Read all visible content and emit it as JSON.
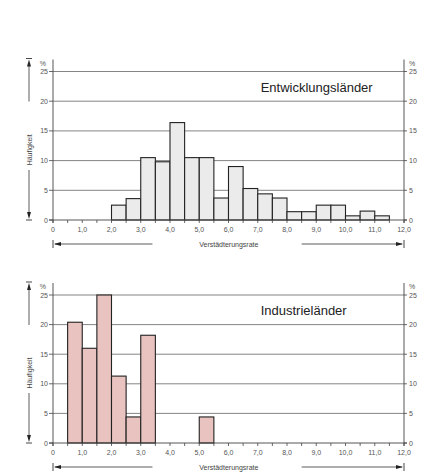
{
  "chart_data": [
    {
      "type": "bar",
      "title": "Entwicklungsländer",
      "xlabel": "Verstädterungsrate",
      "ylabel": "Häufigkeit",
      "yunit": "%",
      "xlim": [
        0,
        12
      ],
      "ylim": [
        0,
        25
      ],
      "yticks": [
        0,
        5,
        10,
        15,
        20,
        25
      ],
      "xticks": [
        "0",
        "1,0",
        "2,0",
        "3,0",
        "4,0",
        "5,0",
        "6,0",
        "7,0",
        "8,0",
        "9,0",
        "10,0",
        "11,0",
        "12,0"
      ],
      "bin_width": 0.5,
      "fill": "#ebebeb",
      "bins": [
        {
          "start": 2.0,
          "value": 2.5
        },
        {
          "start": 2.5,
          "value": 3.6
        },
        {
          "start": 3.0,
          "value": 10.5
        },
        {
          "start": 3.5,
          "value": 9.8
        },
        {
          "start": 4.0,
          "value": 16.4
        },
        {
          "start": 4.5,
          "value": 10.5
        },
        {
          "start": 5.0,
          "value": 10.5
        },
        {
          "start": 5.5,
          "value": 3.7
        },
        {
          "start": 6.0,
          "value": 9.0
        },
        {
          "start": 6.5,
          "value": 5.3
        },
        {
          "start": 7.0,
          "value": 4.4
        },
        {
          "start": 7.5,
          "value": 3.7
        },
        {
          "start": 8.0,
          "value": 1.4
        },
        {
          "start": 8.5,
          "value": 1.4
        },
        {
          "start": 9.0,
          "value": 2.5
        },
        {
          "start": 9.5,
          "value": 2.5
        },
        {
          "start": 10.0,
          "value": 0.7
        },
        {
          "start": 10.5,
          "value": 1.5
        },
        {
          "start": 11.0,
          "value": 0.7
        }
      ],
      "grid": true
    },
    {
      "type": "bar",
      "title": "Industrieländer",
      "xlabel": "Verstädterungsrate",
      "ylabel": "Häufigkeit",
      "yunit": "%",
      "xlim": [
        0,
        12
      ],
      "ylim": [
        0,
        25
      ],
      "yticks": [
        0,
        5,
        10,
        15,
        20,
        25
      ],
      "xticks": [
        "0",
        "1,0",
        "2,0",
        "3,0",
        "4,0",
        "5,0",
        "6,0",
        "7,0",
        "8,0",
        "9,0",
        "10,0",
        "11,0",
        "12,0"
      ],
      "bin_width": 0.5,
      "fill": "#e8c3bf",
      "bins": [
        {
          "start": 0.5,
          "value": 20.4
        },
        {
          "start": 1.0,
          "value": 16.0
        },
        {
          "start": 1.5,
          "value": 25.0
        },
        {
          "start": 2.0,
          "value": 11.3
        },
        {
          "start": 2.5,
          "value": 4.4
        },
        {
          "start": 3.0,
          "value": 18.2
        },
        {
          "start": 5.0,
          "value": 4.4
        }
      ],
      "grid": true
    }
  ],
  "layout": [
    {
      "top": 71.5,
      "bottom": 220,
      "x0": 53,
      "x12": 404
    },
    {
      "top": 295,
      "bottom": 443,
      "x0": 53,
      "x12": 404
    }
  ]
}
